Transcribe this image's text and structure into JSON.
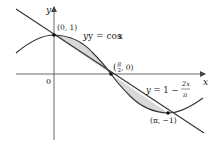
{
  "figure": {
    "axes": {
      "x_label": "x",
      "y_label": "y",
      "origin_label": "0"
    },
    "curves": [
      {
        "name": "cosine",
        "label_prefix": "y = cos ",
        "label_var": "x",
        "equation": "y = cos x"
      },
      {
        "name": "line",
        "label_prefix": "y = 1 − ",
        "frac_num": "2x",
        "frac_den": "π",
        "equation": "y = 1 - 2x/π"
      }
    ],
    "points": [
      {
        "label": "(0, 1)"
      },
      {
        "label_open": "(",
        "frac_num": "π",
        "frac_den": "2",
        "label_close": ", 0)"
      },
      {
        "label": "(π, −1)"
      }
    ],
    "colors": {
      "stroke": "#333333",
      "shade": "#d6d6d6",
      "axis": "#555555"
    }
  }
}
